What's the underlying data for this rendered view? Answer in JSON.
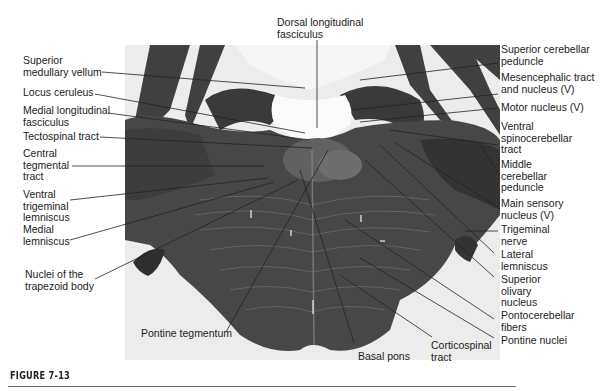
{
  "figure": {
    "caption": "FIGURE 7-13"
  },
  "labels": {
    "top": [
      {
        "id": "dorsal-longitudinal-fasciculus",
        "text": "Dorsal longitudinal\nfasciculus"
      }
    ],
    "left": [
      {
        "id": "superior-medullary-vellum",
        "text": "Superior\nmedullary vellum"
      },
      {
        "id": "locus-ceruleus",
        "text": "Locus ceruleus"
      },
      {
        "id": "medial-longitudinal-fasciculus",
        "text": "Medial longitudinal\nfasciculus"
      },
      {
        "id": "tectospinal-tract",
        "text": "Tectospinal tract"
      },
      {
        "id": "central-tegmental-tract",
        "text": "Central\ntegmental\ntract"
      },
      {
        "id": "ventral-trigeminal-lemniscus",
        "text": "Ventral\ntrigeminal\nlemniscus"
      },
      {
        "id": "medial-lemniscus",
        "text": "Medial\nlemniscus"
      },
      {
        "id": "nuclei-of-trapezoid-body",
        "text": "Nuclei of the\ntrapezoid body"
      }
    ],
    "right": [
      {
        "id": "superior-cerebellar-peduncle",
        "text": "Superior cerebellar\npeduncle"
      },
      {
        "id": "mesencephalic-tract-nucleus",
        "text": "Mesencephalic tract\nand nucleus (V)"
      },
      {
        "id": "motor-nucleus",
        "text": "Motor nucleus (V)"
      },
      {
        "id": "ventral-spinocerebellar-tract",
        "text": "Ventral\nspinocerebellar\ntract"
      },
      {
        "id": "middle-cerebellar-peduncle",
        "text": "Middle\ncerebellar\npeduncle"
      },
      {
        "id": "main-sensory-nucleus",
        "text": "Main sensory\nnucleus (V)"
      },
      {
        "id": "trigeminal-nerve",
        "text": "Trigeminal\nnerve"
      },
      {
        "id": "lateral-lemniscus",
        "text": "Lateral\nlemniscus"
      },
      {
        "id": "superior-olivary-nucleus",
        "text": "Superior\nolivary\nnucleus"
      },
      {
        "id": "pontocerebellar-fibers",
        "text": "Pontocerebellar\nfibers"
      },
      {
        "id": "pontine-nuclei",
        "text": "Pontine nuclei"
      }
    ],
    "bottom": [
      {
        "id": "pontine-tegmentum",
        "text": "Pontine tegmentum"
      },
      {
        "id": "basal-pons",
        "text": "Basal pons"
      },
      {
        "id": "corticospinal-tract",
        "text": "Corticospinal\ntract"
      }
    ]
  },
  "colors": {
    "background": "#ffffff",
    "photo_bg": "#e9e9e9",
    "white_matter_light": "#f2f2f2",
    "dark_tissue": "#3a3a3a",
    "mid_tissue": "#5c5c5c",
    "leader_line": "#222222",
    "label_text": "#1c1c1c"
  }
}
